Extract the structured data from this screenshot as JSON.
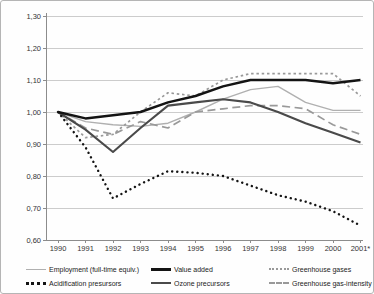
{
  "figure": {
    "kind": "line-chart-panel",
    "colors": {
      "background": "#fefefe",
      "border": "#b5b5b5",
      "axis": "#8c8c8c",
      "grid": "#cccccc",
      "text": "#333333"
    }
  },
  "chart_data": {
    "type": "line",
    "title": "",
    "xlabel": "",
    "ylabel": "",
    "grid": true,
    "legend_position": "bottom",
    "ylim": [
      0.6,
      1.3
    ],
    "y_ticks": [
      1.3,
      1.2,
      1.1,
      1.0,
      0.9,
      0.8,
      0.7,
      0.6
    ],
    "y_tick_labels": [
      "1,30",
      "1,20",
      "1,10",
      "1,00",
      "0,90",
      "0,80",
      "0,70",
      "0,60"
    ],
    "x": [
      1990,
      1991,
      1992,
      1993,
      1994,
      1995,
      1996,
      1997,
      1998,
      1999,
      2000,
      2001
    ],
    "x_tick_labels": [
      "1990",
      "1991",
      "1992",
      "1993",
      "1994",
      "1995",
      "1996",
      "1997",
      "1998",
      "1999",
      "2000",
      "2001*"
    ],
    "series": [
      {
        "name": "Employment (full-time equiv.)",
        "key": "employment",
        "style": "solid",
        "color": "#b0b0b0",
        "width": 1.4,
        "values": [
          1.0,
          0.97,
          0.96,
          0.955,
          0.965,
          1.0,
          1.04,
          1.07,
          1.08,
          1.03,
          1.005,
          1.005
        ]
      },
      {
        "name": "Value added",
        "key": "value-added",
        "style": "solid",
        "color": "#141414",
        "width": 2.5,
        "values": [
          1.0,
          0.98,
          0.99,
          1.0,
          1.03,
          1.05,
          1.08,
          1.1,
          1.1,
          1.1,
          1.09,
          1.1
        ]
      },
      {
        "name": "Greenhouse gases",
        "key": "greenhouse-gases",
        "style": "dotted",
        "color": "#999999",
        "width": 1.7,
        "values": [
          1.0,
          0.92,
          0.93,
          1.0,
          1.06,
          1.05,
          1.1,
          1.12,
          1.12,
          1.12,
          1.12,
          1.05
        ]
      },
      {
        "name": "Acidification presursors",
        "key": "acidification-precursors",
        "style": "dots",
        "color": "#141414",
        "width": 2.4,
        "values": [
          1.0,
          0.89,
          0.73,
          0.775,
          0.815,
          0.81,
          0.8,
          0.77,
          0.74,
          0.72,
          0.69,
          0.645
        ]
      },
      {
        "name": "Ozone precursors",
        "key": "ozone-precursors",
        "style": "solid",
        "color": "#4a4a4a",
        "width": 2.1,
        "values": [
          1.0,
          0.945,
          0.875,
          0.95,
          1.02,
          1.03,
          1.04,
          1.03,
          1.0,
          0.965,
          0.935,
          0.905
        ]
      },
      {
        "name": "Greenhouse gas-intensity",
        "key": "greenhouse-gas-intensity",
        "style": "dashed",
        "color": "#999999",
        "width": 1.7,
        "values": [
          1.0,
          0.95,
          0.93,
          0.97,
          0.95,
          1.0,
          1.01,
          1.02,
          1.02,
          1.01,
          0.96,
          0.93
        ]
      }
    ]
  }
}
